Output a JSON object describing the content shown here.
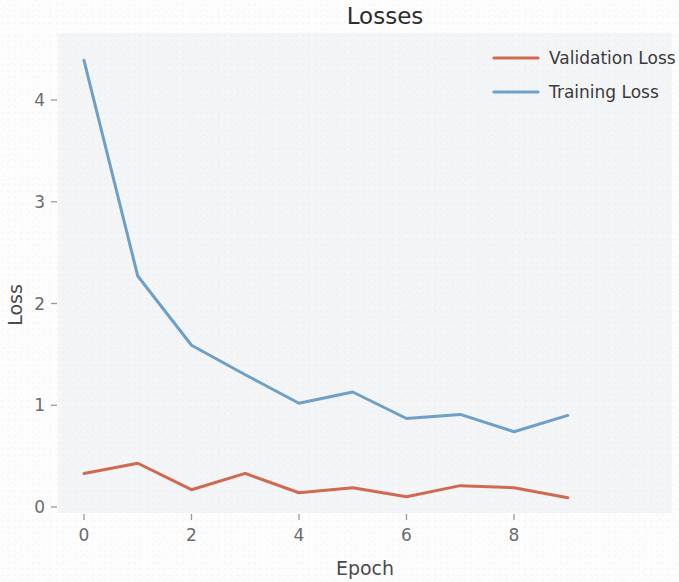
{
  "chart_data": {
    "type": "line",
    "title": "Losses",
    "xlabel": "Epoch",
    "ylabel": "Loss",
    "x": [
      0,
      1,
      2,
      3,
      4,
      5,
      6,
      7,
      8,
      9
    ],
    "xticks": [
      0,
      2,
      4,
      6,
      8
    ],
    "xtick_labels": [
      "0",
      "2",
      "4",
      "6",
      "8"
    ],
    "yticks": [
      0,
      1,
      2,
      3,
      4
    ],
    "ytick_labels": [
      "0",
      "1",
      "2",
      "3",
      "4"
    ],
    "xlim": [
      -0.45,
      9.45
    ],
    "ylim": [
      -0.17,
      4.62
    ],
    "grid": false,
    "legend_position": "upper right",
    "series": [
      {
        "name": "Validation Loss",
        "color": "#d0694f",
        "values": [
          0.33,
          0.43,
          0.17,
          0.33,
          0.14,
          0.19,
          0.1,
          0.21,
          0.19,
          0.09
        ]
      },
      {
        "name": "Training Loss",
        "color": "#6e9fc8",
        "values": [
          4.39,
          2.27,
          1.59,
          1.3,
          1.02,
          1.13,
          0.87,
          0.91,
          0.74,
          0.9
        ]
      }
    ]
  },
  "legend": {
    "entries": [
      {
        "label": "Validation Loss",
        "color": "#d0694f"
      },
      {
        "label": "Training Loss",
        "color": "#6e9fc8"
      }
    ]
  },
  "geometry": {
    "plot_left": 58,
    "plot_right": 672,
    "plot_top": 33,
    "plot_bottom": 513,
    "x0_px": 84,
    "x_step_px": 53.75,
    "y0_px": 507,
    "y_unit_px": 101.75
  }
}
